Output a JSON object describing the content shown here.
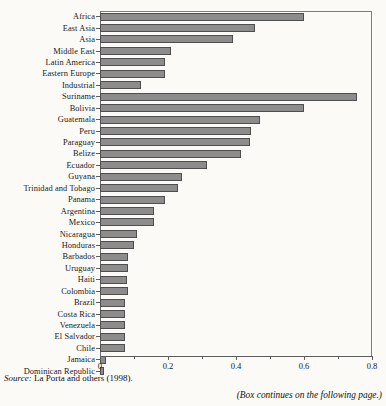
{
  "figure": {
    "source_prefix": "Source:",
    "source_text": " La Porta and others (1998).",
    "continues_note": "(Box continues on the following page.)",
    "bar_color": "#8c8c8c",
    "bar_border_color": "#4e4e4e",
    "page_background": "#fbfaf7"
  },
  "chart_data": {
    "type": "bar",
    "orientation": "horizontal",
    "title": "",
    "xlabel": "",
    "ylabel": "",
    "xlim": [
      0,
      0.8
    ],
    "grid": false,
    "legend": false,
    "xticks": [
      0,
      0.2,
      0.4,
      0.6,
      0.8
    ],
    "xtick_labels": [
      "0",
      "0.2",
      "0.4",
      "0.6",
      "0.8"
    ],
    "xticks_minor": [
      0.1,
      0.3,
      0.5,
      0.7
    ],
    "categories": [
      "Africa",
      "East Asia",
      "Asia",
      "Middle East",
      "Latin America",
      "Eastern Europe",
      "Industrial",
      "Suriname",
      "Bolivia",
      "Guatemala",
      "Peru",
      "Paraguay",
      "Belize",
      "Ecuador",
      "Guyana",
      "Trinidad and Tobago",
      "Panama",
      "Argentina",
      "Mexico",
      "Nicaragua",
      "Honduras",
      "Barbados",
      "Uruguay",
      "Haiti",
      "Colombia",
      "Brazil",
      "Costa Rica",
      "Venezuela",
      "El Salvador",
      "Chile",
      "Jamaica",
      "Dominican Republic"
    ],
    "values": [
      0.6,
      0.455,
      0.39,
      0.21,
      0.19,
      0.19,
      0.12,
      0.755,
      0.6,
      0.47,
      0.445,
      0.44,
      0.415,
      0.315,
      0.24,
      0.23,
      0.19,
      0.16,
      0.16,
      0.11,
      0.1,
      0.083,
      0.081,
      0.08,
      0.083,
      0.074,
      0.073,
      0.073,
      0.073,
      0.073,
      0.018,
      0.012
    ]
  }
}
